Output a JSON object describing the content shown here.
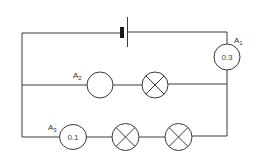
{
  "diagram": {
    "type": "electric-circuit",
    "colors": {
      "line": "#3a3a3a",
      "background": "#ffffff"
    },
    "components": {
      "cell": {
        "name": "battery-cell"
      },
      "ammeters": [
        {
          "id": "A1",
          "label_main": "A",
          "label_sub": "1",
          "reading": "0.3",
          "location": "main-branch-right"
        },
        {
          "id": "A2",
          "label_main": "A",
          "label_sub": "2",
          "reading": "",
          "location": "middle-branch"
        },
        {
          "id": "A3",
          "label_main": "A",
          "label_sub": "3",
          "reading": "0.1",
          "location": "bottom-branch"
        }
      ],
      "lamps": [
        {
          "id": "lamp-1",
          "location": "middle-branch"
        },
        {
          "id": "lamp-2",
          "location": "bottom-branch"
        },
        {
          "id": "lamp-3",
          "location": "bottom-branch"
        }
      ]
    }
  }
}
